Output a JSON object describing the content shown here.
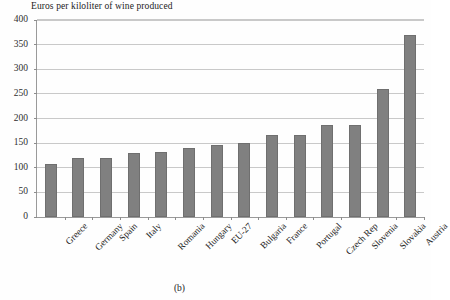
{
  "chart_data": {
    "type": "bar",
    "title": "Euros per kiloliter of wine produced",
    "xlabel": "",
    "ylabel": "",
    "ylim": [
      0,
      400
    ],
    "ytick_step": 50,
    "yticks": [
      0,
      50,
      100,
      150,
      200,
      250,
      300,
      350,
      400
    ],
    "grid": true,
    "legend": "none",
    "bar_color": "#808080",
    "categories": [
      "Greece",
      "Germany",
      "Spain",
      "Italy",
      "Romania",
      "Hungary",
      "EU-27",
      "Bulgaria",
      "France",
      "Portugal",
      "Czech Rep",
      "Slovenia",
      "Slovakia",
      "Austria"
    ],
    "values": [
      108,
      120,
      120,
      130,
      132,
      140,
      146,
      151,
      166,
      167,
      186,
      187,
      259,
      369
    ],
    "caption": "(b)"
  }
}
